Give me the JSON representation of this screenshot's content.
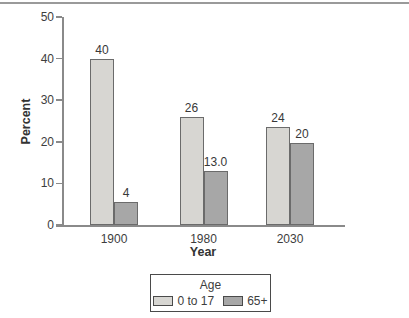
{
  "figure": {
    "background": "#ffffff",
    "top_rule_color": "#9a9a9a"
  },
  "chart_data": {
    "type": "bar",
    "title": "",
    "xlabel": "Year",
    "ylabel": "Percent",
    "categories": [
      "1900",
      "1980",
      "2030"
    ],
    "series": [
      {
        "name": "0 to 17",
        "values": [
          40,
          26,
          24
        ],
        "labels": [
          "40",
          "26",
          "24"
        ],
        "drawn_values": [
          40,
          26,
          23.5
        ],
        "color": "#d7d6d2"
      },
      {
        "name": "65+",
        "values": [
          4,
          13.0,
          20
        ],
        "labels": [
          "4",
          "13.0",
          "20"
        ],
        "drawn_values": [
          5.5,
          13,
          19.8
        ],
        "color": "#a7a7a7"
      }
    ],
    "ylim": [
      0,
      50
    ],
    "yticks": [
      0,
      10,
      20,
      30,
      40,
      50
    ],
    "grid": false,
    "legend_title": "Age",
    "legend_position": "bottom-center",
    "bar_edge_color": "#6b6b6b",
    "axis_color": "#8a8a8a"
  }
}
